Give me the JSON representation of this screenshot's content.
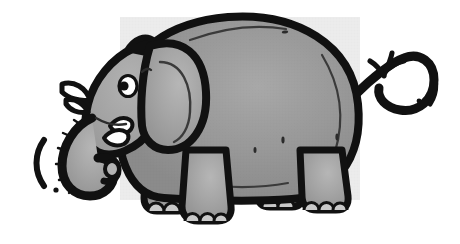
{
  "image": {
    "subject": "cartoon-elephant",
    "caption": "Cartoon elephant facing left with curled trunk, raised tusks, large ear, round body and looping tail",
    "style": "black-outline clip-art with halftone gray fill",
    "orientation": "facing-left",
    "width": 460,
    "height": 244
  },
  "colors": {
    "background": "#ffffff",
    "outline": "#111111",
    "body_fill": "#a3a3a3",
    "body_fill_light": "#b4b4b4",
    "body_fill_shadow": "#949494",
    "tusk_fill": "#ffffff",
    "toenail_fill": "#c9c9c9",
    "eye_white": "#ffffff",
    "eye_pupil": "#111111"
  },
  "parts": {
    "body": "body",
    "head": "head",
    "ear": "ear",
    "eye": "eye",
    "trunk": "trunk",
    "tusk_upper": "upper-tusk",
    "tusk_lower": "lower-tusk",
    "foreleg_front": "front-foreleg",
    "foreleg_back": "rear-foreleg",
    "hindleg_front": "front-hindleg",
    "hindleg_back": "rear-hindleg",
    "tail": "tail",
    "tail_tuft": "tail-tuft",
    "belly_line": "belly-crease",
    "back_line": "back-crease",
    "motion_trunk": "trunk-motion-lines",
    "motion_tail": "tail-motion-lines"
  },
  "details": {
    "toenails_per_front_foot": 3,
    "toenails_per_hind_foot": 3,
    "tusk_count": 2,
    "tail_tuft_strands": 3,
    "motion_arcs_left": 1,
    "motion_dots_left": 1,
    "motion_arcs_right": 1,
    "motion_dots_right": 1,
    "skin_marks": 6
  }
}
